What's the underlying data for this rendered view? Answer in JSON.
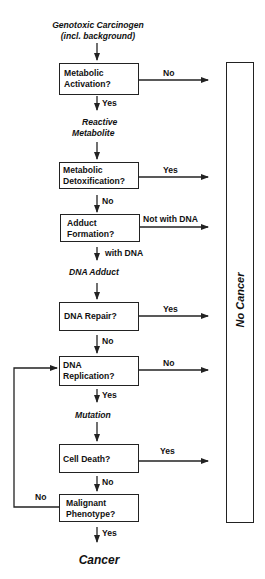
{
  "diagram": {
    "start": {
      "line1": "Genotoxic Carcinogen",
      "line2": "(incl. background)"
    },
    "decisions": [
      {
        "id": "metabolic-activation",
        "line1": "Metabolic",
        "line2": "Activation?",
        "exit_label": "No",
        "continue_label": "Yes"
      },
      {
        "id": "metabolic-detoxification",
        "line1": "Metabolic",
        "line2": "Detoxification?",
        "exit_label": "Yes",
        "continue_label": "No"
      },
      {
        "id": "adduct-formation",
        "line1": "Adduct",
        "line2": "Formation?",
        "exit_label": "Not with DNA",
        "continue_label": "with DNA"
      },
      {
        "id": "dna-repair",
        "line1": "DNA Repair?",
        "line2": "",
        "exit_label": "Yes",
        "continue_label": "No"
      },
      {
        "id": "dna-replication",
        "line1": "DNA",
        "line2": "Replication?",
        "exit_label": "No",
        "continue_label": "Yes"
      },
      {
        "id": "cell-death",
        "line1": "Cell Death?",
        "line2": "",
        "exit_label": "Yes",
        "continue_label": "No"
      },
      {
        "id": "malignant-phenotype",
        "line1": "Malignant",
        "line2": "Phenotype?",
        "exit_label": "No",
        "continue_label": "Yes"
      }
    ],
    "intermediates": {
      "reactive_metabolite": {
        "line1": "Reactive",
        "line2": "Metabolite"
      },
      "dna_adduct": "DNA Adduct",
      "mutation": "Mutation"
    },
    "outcomes": {
      "no_cancer": "No Cancer",
      "cancer": "Cancer"
    },
    "colors": {
      "line": "#222222",
      "text": "#111111",
      "background": "#ffffff"
    }
  }
}
